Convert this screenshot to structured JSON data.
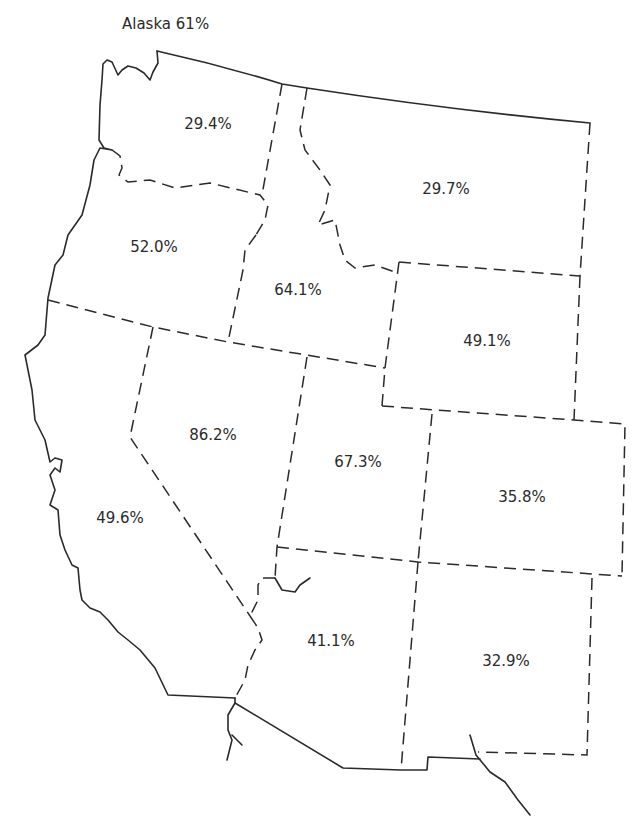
{
  "title": "Alaska 61%",
  "states": [
    {
      "name": "Washington",
      "value": "29.4%"
    },
    {
      "name": "Oregon",
      "value": "52.0%"
    },
    {
      "name": "Idaho",
      "value": "64.1%"
    },
    {
      "name": "Montana",
      "value": "29.7%"
    },
    {
      "name": "Wyoming",
      "value": "49.1%"
    },
    {
      "name": "California",
      "value": "49.6%"
    },
    {
      "name": "Nevada",
      "value": "86.2%"
    },
    {
      "name": "Utah",
      "value": "67.3%"
    },
    {
      "name": "Colorado",
      "value": "35.8%"
    },
    {
      "name": "Arizona",
      "value": "41.1%"
    },
    {
      "name": "New Mexico",
      "value": "32.9%"
    }
  ],
  "colors": {
    "line": "#2a2a2a",
    "background": "#ffffff"
  }
}
